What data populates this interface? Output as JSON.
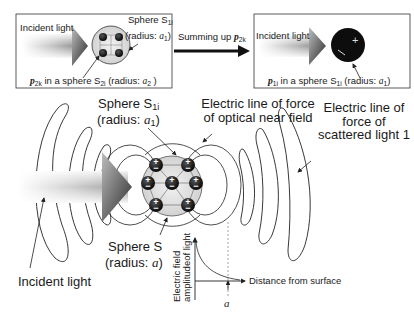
{
  "top_left_box": {
    "incident_label": "Incident light",
    "sphere_label": "Sphere S",
    "sphere_sub": "1i",
    "radius_label": "(radius: ",
    "radius_var": "a",
    "radius_sub": "1",
    "radius_close": ")",
    "caption_var": "p",
    "caption_var_sub": "2k",
    "caption_mid": " in a sphere S",
    "caption_sphere_sub": "2i",
    "caption_radius": " (radius: ",
    "caption_radius_var": "a",
    "caption_radius_sub": "2",
    "caption_close": " )"
  },
  "summing_arrow": {
    "label": "Summing up ",
    "var": "p",
    "var_sub": "2k"
  },
  "top_right_box": {
    "incident_label": "Incident light",
    "caption_var": "p",
    "caption_var_sub": "1i",
    "caption_mid": " in a sphere S",
    "caption_sphere_sub": "1i",
    "caption_radius": " (radius: ",
    "caption_radius_var": "a",
    "caption_radius_sub": "1",
    "caption_close": ")"
  },
  "main": {
    "sphere_s1i_label": "Sphere S",
    "sphere_s1i_sub": "1i",
    "sphere_s1i_radius": "(radius: ",
    "sphere_s1i_radius_var": "a",
    "sphere_s1i_radius_sub": "1",
    "sphere_s1i_close": ")",
    "near_field_line1": "Electric line of force",
    "near_field_line2": "of optical near field",
    "scattered_line1": "Electric line of",
    "scattered_line2": "force of",
    "scattered_line3": "scattered light 1",
    "sphere_s_label": "Sphere S",
    "sphere_s_radius": "(radius: ",
    "sphere_s_radius_var": "a",
    "sphere_s_close": ")",
    "incident_label": "Incident light"
  },
  "graph": {
    "ylabel_line1": "Electric field",
    "ylabel_line2": "amplitudeof light",
    "xlabel": "Distance from surface",
    "marker": "a"
  }
}
